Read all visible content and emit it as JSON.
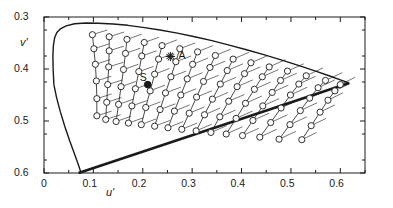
{
  "figure": {
    "kind": "cie-1976-ucs-chromaticity-diagram",
    "background": "#ffffff",
    "ink": "#1a1a1a"
  },
  "axes": {
    "x_label": "u'",
    "y_label": "v'",
    "x_ticks": [
      "0",
      "0.1",
      "0.2",
      "0.3",
      "0.4",
      "0.5",
      "0.6"
    ],
    "y_ticks": [
      "0.6",
      "0.5",
      "0.4",
      "0.3"
    ]
  },
  "annotations": {
    "illuminant_a": "A",
    "source_s": "S"
  },
  "chart_data": {
    "type": "scatter",
    "title": "",
    "xlabel": "u'",
    "ylabel": "v'",
    "xlim": [
      0.0,
      0.65
    ],
    "ylim": [
      0.3,
      0.6
    ],
    "x_ticks": [
      0,
      0.1,
      0.2,
      0.3,
      0.4,
      0.5,
      0.6
    ],
    "y_ticks": [
      0.3,
      0.4,
      0.5,
      0.6
    ],
    "grid": false,
    "legend": null,
    "minor_ticks": true,
    "spectral_locus": [
      [
        0.02,
        0.47
      ],
      [
        0.0185,
        0.5
      ],
      [
        0.018,
        0.525
      ],
      [
        0.019,
        0.545
      ],
      [
        0.0215,
        0.56
      ],
      [
        0.026,
        0.57
      ],
      [
        0.033,
        0.577
      ],
      [
        0.045,
        0.583
      ],
      [
        0.062,
        0.587
      ],
      [
        0.085,
        0.5885
      ],
      [
        0.11,
        0.588
      ],
      [
        0.14,
        0.5865
      ],
      [
        0.17,
        0.584
      ],
      [
        0.2,
        0.58
      ],
      [
        0.235,
        0.575
      ],
      [
        0.27,
        0.569
      ],
      [
        0.305,
        0.562
      ],
      [
        0.34,
        0.5545
      ],
      [
        0.375,
        0.546
      ],
      [
        0.41,
        0.537
      ],
      [
        0.445,
        0.5275
      ],
      [
        0.48,
        0.5175
      ],
      [
        0.515,
        0.507
      ],
      [
        0.55,
        0.496
      ],
      [
        0.58,
        0.486
      ],
      [
        0.6,
        0.479
      ],
      [
        0.612,
        0.475
      ],
      [
        0.618,
        0.473
      ]
    ],
    "purple_line": [
      [
        0.618,
        0.473
      ],
      [
        0.07,
        0.3
      ]
    ],
    "lower_locus": [
      [
        0.02,
        0.47
      ],
      [
        0.0255,
        0.445
      ],
      [
        0.033,
        0.418
      ],
      [
        0.042,
        0.39
      ],
      [
        0.052,
        0.362
      ],
      [
        0.062,
        0.336
      ],
      [
        0.07,
        0.315
      ],
      [
        0.075,
        0.3
      ]
    ],
    "markers": {
      "illuminant_a": {
        "label": "A",
        "x": 0.256,
        "y": 0.524,
        "style": "star"
      },
      "source_s": {
        "label": "S",
        "x": 0.21,
        "y": 0.47,
        "style": "filled-circle"
      }
    },
    "chains_note": "Chains of open-circle samples along constant-dominant-wavelength lines converging to the long-wavelength apex; each circle carries a short line segment (chromaticity-shift vector).",
    "chains": [
      {
        "points": [
          [
            0.098,
            0.566
          ],
          [
            0.101,
            0.539
          ],
          [
            0.104,
            0.509
          ],
          [
            0.106,
            0.477
          ],
          [
            0.107,
            0.443
          ],
          [
            0.107,
            0.41
          ]
        ],
        "vec": [
          0.03,
          0.009
        ]
      },
      {
        "points": [
          [
            0.132,
            0.562
          ],
          [
            0.132,
            0.535
          ],
          [
            0.131,
            0.504
          ],
          [
            0.129,
            0.47
          ],
          [
            0.127,
            0.436
          ],
          [
            0.125,
            0.403
          ]
        ],
        "vec": [
          0.03,
          0.009
        ]
      },
      {
        "points": [
          [
            0.168,
            0.557
          ],
          [
            0.165,
            0.53
          ],
          [
            0.161,
            0.499
          ],
          [
            0.156,
            0.466
          ],
          [
            0.151,
            0.432
          ],
          [
            0.146,
            0.399
          ]
        ],
        "vec": [
          0.03,
          0.01
        ]
      },
      {
        "points": [
          [
            0.203,
            0.551
          ],
          [
            0.198,
            0.525
          ],
          [
            0.192,
            0.495
          ],
          [
            0.185,
            0.462
          ],
          [
            0.178,
            0.429
          ],
          [
            0.171,
            0.396
          ]
        ],
        "vec": [
          0.03,
          0.01
        ]
      },
      {
        "points": [
          [
            0.239,
            0.545
          ],
          [
            0.232,
            0.519
          ],
          [
            0.224,
            0.49
          ],
          [
            0.215,
            0.458
          ],
          [
            0.206,
            0.426
          ],
          [
            0.197,
            0.393
          ]
        ],
        "vec": [
          0.03,
          0.011
        ]
      },
      {
        "points": [
          [
            0.275,
            0.539
          ],
          [
            0.267,
            0.514
          ],
          [
            0.257,
            0.485
          ],
          [
            0.246,
            0.454
          ],
          [
            0.235,
            0.422
          ],
          [
            0.224,
            0.39
          ]
        ],
        "vec": [
          0.031,
          0.011
        ]
      },
      {
        "points": [
          [
            0.311,
            0.533
          ],
          [
            0.301,
            0.509
          ],
          [
            0.29,
            0.481
          ],
          [
            0.277,
            0.45
          ],
          [
            0.264,
            0.419
          ],
          [
            0.251,
            0.387
          ]
        ],
        "vec": [
          0.031,
          0.012
        ]
      },
      {
        "points": [
          [
            0.347,
            0.526
          ],
          [
            0.336,
            0.503
          ],
          [
            0.323,
            0.476
          ],
          [
            0.309,
            0.446
          ],
          [
            0.294,
            0.415
          ],
          [
            0.279,
            0.384
          ]
        ],
        "vec": [
          0.031,
          0.012
        ]
      },
      {
        "points": [
          [
            0.383,
            0.519
          ],
          [
            0.371,
            0.497
          ],
          [
            0.357,
            0.471
          ],
          [
            0.341,
            0.442
          ],
          [
            0.325,
            0.412
          ],
          [
            0.308,
            0.381
          ]
        ],
        "vec": [
          0.032,
          0.013
        ]
      },
      {
        "points": [
          [
            0.419,
            0.512
          ],
          [
            0.406,
            0.491
          ],
          [
            0.391,
            0.466
          ],
          [
            0.374,
            0.438
          ],
          [
            0.356,
            0.408
          ],
          [
            0.338,
            0.378
          ]
        ],
        "vec": [
          0.032,
          0.013
        ]
      },
      {
        "points": [
          [
            0.456,
            0.504
          ],
          [
            0.442,
            0.485
          ],
          [
            0.426,
            0.461
          ],
          [
            0.408,
            0.434
          ],
          [
            0.389,
            0.405
          ],
          [
            0.369,
            0.375
          ]
        ],
        "vec": [
          0.033,
          0.014
        ]
      },
      {
        "points": [
          [
            0.493,
            0.496
          ],
          [
            0.479,
            0.478
          ],
          [
            0.462,
            0.455
          ],
          [
            0.443,
            0.429
          ],
          [
            0.423,
            0.401
          ],
          [
            0.402,
            0.372
          ]
        ],
        "vec": [
          0.033,
          0.014
        ]
      },
      {
        "points": [
          [
            0.531,
            0.487
          ],
          [
            0.516,
            0.471
          ],
          [
            0.499,
            0.45
          ],
          [
            0.48,
            0.425
          ],
          [
            0.459,
            0.397
          ],
          [
            0.437,
            0.369
          ]
        ],
        "vec": [
          0.034,
          0.015
        ]
      },
      {
        "points": [
          [
            0.57,
            0.478
          ],
          [
            0.555,
            0.464
          ],
          [
            0.538,
            0.444
          ],
          [
            0.519,
            0.42
          ],
          [
            0.498,
            0.393
          ],
          [
            0.476,
            0.365
          ]
        ],
        "vec": [
          0.034,
          0.015
        ]
      },
      {
        "points": [
          [
            0.6,
            0.47
          ],
          [
            0.589,
            0.458
          ],
          [
            0.575,
            0.44
          ],
          [
            0.559,
            0.417
          ],
          [
            0.541,
            0.391
          ],
          [
            0.522,
            0.364
          ]
        ],
        "vec": [
          0.03,
          0.014
        ]
      }
    ]
  }
}
